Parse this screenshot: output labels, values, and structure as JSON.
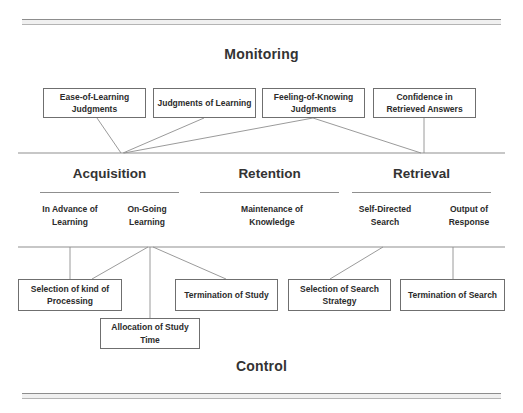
{
  "figure": {
    "top_label": "Monitoring",
    "bottom_label": "Control"
  },
  "monitoring_nodes": [
    {
      "id": "ease-of-learning-judgments",
      "label": "Ease-of-Learning Judgments",
      "x": 43,
      "y": 88,
      "w": 103,
      "h": 30
    },
    {
      "id": "judgments-of-learning",
      "label": "Judgments of Learning",
      "x": 153,
      "y": 88,
      "w": 103,
      "h": 30
    },
    {
      "id": "feeling-of-knowing-judgments",
      "label": "Feeling-of-Knowing Judgments",
      "x": 262,
      "y": 88,
      "w": 103,
      "h": 30
    },
    {
      "id": "confidence-in-retrieved-answers",
      "label": "Confidence in Retrieved Answers",
      "x": 373,
      "y": 88,
      "w": 103,
      "h": 30
    }
  ],
  "stages": [
    {
      "id": "acquisition",
      "name": "Acquisition",
      "underline": {
        "x": 40,
        "y": 192,
        "w": 139
      },
      "name_box": {
        "x": 40,
        "y": 166,
        "w": 139
      },
      "substages": [
        {
          "id": "in-advance-of-learning",
          "label": "In Advance of Learning",
          "x": 33,
          "y": 203,
          "w": 74
        },
        {
          "id": "on-going-learning",
          "label": "On-Going Learning",
          "x": 110,
          "y": 203,
          "w": 74
        }
      ]
    },
    {
      "id": "retention",
      "name": "Retention",
      "underline": {
        "x": 200,
        "y": 192,
        "w": 139
      },
      "name_box": {
        "x": 200,
        "y": 166,
        "w": 139
      },
      "substages": [
        {
          "id": "maintenance-of-knowledge",
          "label": "Maintenance of Knowledge",
          "x": 232,
          "y": 203,
          "w": 80
        }
      ]
    },
    {
      "id": "retrieval",
      "name": "Retrieval",
      "underline": {
        "x": 352,
        "y": 192,
        "w": 139
      },
      "name_box": {
        "x": 352,
        "y": 166,
        "w": 139
      },
      "substages": [
        {
          "id": "self-directed-search",
          "label": "Self-Directed Search",
          "x": 348,
          "y": 203,
          "w": 74
        },
        {
          "id": "output-of-response",
          "label": "Output of Response",
          "x": 432,
          "y": 203,
          "w": 74
        }
      ]
    }
  ],
  "control_nodes": [
    {
      "id": "selection-of-kind-of-processing",
      "label": "Selection of kind of Processing",
      "x": 18,
      "y": 279,
      "w": 104,
      "h": 32
    },
    {
      "id": "allocation-of-study-time",
      "label": "Allocation of Study Time",
      "x": 100,
      "y": 318,
      "w": 100,
      "h": 31
    },
    {
      "id": "termination-of-study",
      "label": "Termination of Study",
      "x": 175,
      "y": 279,
      "w": 103,
      "h": 32
    },
    {
      "id": "selection-of-search-strategy",
      "label": "Selection of Search Strategy",
      "x": 288,
      "y": 279,
      "w": 103,
      "h": 32
    },
    {
      "id": "termination-of-search",
      "label": "Termination of Search",
      "x": 400,
      "y": 279,
      "w": 105,
      "h": 32
    }
  ],
  "divider_lines": [
    {
      "id": "monitoring-baseline",
      "x1": 18,
      "y1": 153,
      "x2": 505,
      "y2": 153
    },
    {
      "id": "control-baseline",
      "x1": 18,
      "y1": 247,
      "x2": 505,
      "y2": 247
    }
  ],
  "connectors": [
    {
      "id": "wire-ease-of-learning",
      "x1": 97,
      "y1": 118,
      "x2": 121,
      "y2": 153
    },
    {
      "id": "wire-judgments-of-learning",
      "x1": 204,
      "y1": 118,
      "x2": 123,
      "y2": 153
    },
    {
      "id": "wire-feeling-left",
      "x1": 313,
      "y1": 118,
      "x2": 124,
      "y2": 153
    },
    {
      "id": "wire-feeling-right",
      "x1": 313,
      "y1": 118,
      "x2": 421,
      "y2": 153
    },
    {
      "id": "wire-confidence-vertical",
      "x1": 424,
      "y1": 118,
      "x2": 424,
      "y2": 153
    },
    {
      "id": "wire-processing-vertical",
      "x1": 70,
      "y1": 247,
      "x2": 70,
      "y2": 279
    },
    {
      "id": "wire-processing-diagonal",
      "x1": 148,
      "y1": 247,
      "x2": 92,
      "y2": 279
    },
    {
      "id": "wire-allocation-vertical",
      "x1": 150,
      "y1": 247,
      "x2": 150,
      "y2": 318
    },
    {
      "id": "wire-termination-study",
      "x1": 153,
      "y1": 247,
      "x2": 226,
      "y2": 279
    },
    {
      "id": "wire-search-strategy",
      "x1": 383,
      "y1": 247,
      "x2": 330,
      "y2": 279
    },
    {
      "id": "wire-termination-search",
      "x1": 453,
      "y1": 247,
      "x2": 453,
      "y2": 279
    }
  ],
  "colors": {
    "ink": "#2b2b2b",
    "line": "#8f8f8f",
    "box_border": "#6f6f6f",
    "rule": "#8d8d8d",
    "background": "#ffffff"
  }
}
